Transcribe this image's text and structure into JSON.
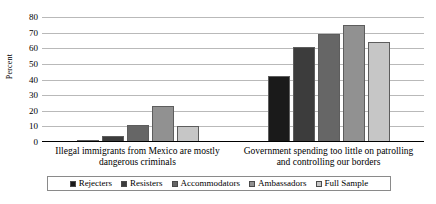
{
  "chart_data": {
    "type": "bar",
    "title": "",
    "xlabel": "",
    "ylabel": "Percent",
    "ylim": [
      0,
      80
    ],
    "ytick_step": 10,
    "yticks": [
      80,
      70,
      60,
      50,
      40,
      30,
      20,
      10,
      0
    ],
    "grid": true,
    "legend_position": "bottom",
    "categories": [
      "Illegal immigrants from Mexico are mostly dangerous criminals",
      "Government spending too little on patrolling and controlling our borders"
    ],
    "series": [
      {
        "name": "Rejecters",
        "color": "#1a1a1a",
        "values": [
          1,
          42
        ]
      },
      {
        "name": "Resisters",
        "color": "#3c3c3c",
        "values": [
          4,
          61
        ]
      },
      {
        "name": "Accommodators",
        "color": "#666666",
        "values": [
          11,
          69
        ]
      },
      {
        "name": "Ambassadors",
        "color": "#919191",
        "values": [
          23,
          75
        ]
      },
      {
        "name": "Full Sample",
        "color": "#c6c6c6",
        "values": [
          10,
          64
        ]
      }
    ]
  },
  "axis": {
    "gridline_color": "#b9b9b9",
    "baseline_color": "#000000"
  }
}
